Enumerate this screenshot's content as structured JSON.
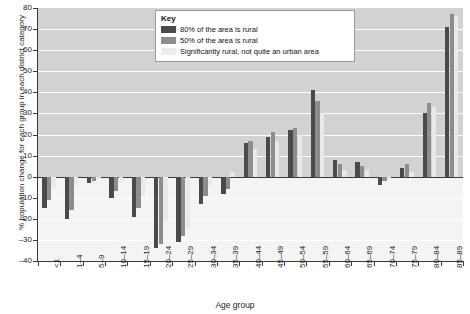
{
  "chart_data": {
    "type": "bar",
    "title": "",
    "xlabel": "Age group",
    "ylabel": "% population change for each group in each district category",
    "ylim": [
      -40,
      80
    ],
    "ytick_step": 10,
    "yticks": [
      80,
      70,
      60,
      50,
      40,
      30,
      20,
      10,
      0,
      -10,
      -20,
      -30,
      -40
    ],
    "grid": "horizontal",
    "legend_position": "top-center",
    "legend_title": "Key",
    "categories": [
      "<1",
      "1–4",
      "5–9",
      "10–14",
      "15–19",
      "20–24",
      "25–29",
      "30–34",
      "35–39",
      "40–44",
      "45–49",
      "50–54",
      "55–59",
      "60–64",
      "65–69",
      "70–74",
      "75–79",
      "80–84",
      "85–89"
    ],
    "series": [
      {
        "name": "80% of the area is rural",
        "color": "#4a4a4a",
        "values": [
          -15,
          -20,
          -3,
          -10,
          -19,
          -34,
          -31,
          -13,
          -8,
          16,
          19,
          22,
          41,
          8,
          7,
          -4,
          4,
          30,
          71
        ]
      },
      {
        "name": "50% of the area is rural",
        "color": "#8d8d8d",
        "values": [
          -11,
          -16,
          -2,
          -7,
          -15,
          -32,
          -28,
          -9,
          -6,
          17,
          21,
          23,
          36,
          6,
          5,
          -2,
          6,
          35,
          77
        ]
      },
      {
        "name": "Significantly rural, not quite an urban area",
        "color": "#e9e9e9",
        "values": [
          -5,
          -4,
          -1,
          -3,
          -9,
          -21,
          -25,
          -4,
          2,
          13,
          17,
          20,
          30,
          3,
          3,
          -1,
          2,
          33,
          76
        ]
      }
    ]
  },
  "legend": {
    "title": "Key",
    "items": [
      {
        "label": "80% of the area is rural",
        "swatch": "dark-gray-swatch"
      },
      {
        "label": "50% of the area is rural",
        "swatch": "mid-gray-swatch"
      },
      {
        "label": "Significantly rural, not quite an urban area",
        "swatch": "light-gray-swatch"
      }
    ]
  }
}
